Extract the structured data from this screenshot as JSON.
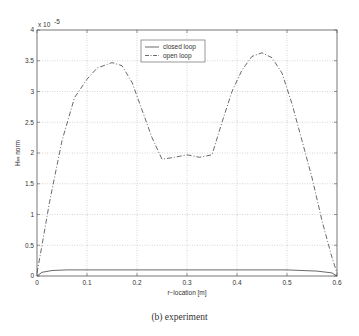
{
  "caption": "(b) experiment",
  "chart_data": {
    "type": "line",
    "title": "",
    "xlabel": "r−location [m]",
    "ylabel": "H_∞ norm",
    "y_multiplier": "x 10^-5",
    "xlim": [
      0,
      0.6
    ],
    "ylim": [
      0,
      4
    ],
    "xticks": [
      0,
      0.1,
      0.2,
      0.3,
      0.4,
      0.5,
      0.6
    ],
    "xtick_labels": [
      "0",
      "0.1",
      "0.2",
      "0.3",
      "0.4",
      "0.5",
      "0.6"
    ],
    "yticks": [
      0,
      0.5,
      1,
      1.5,
      2,
      2.5,
      3,
      3.5,
      4
    ],
    "ytick_labels": [
      "0",
      "0.5",
      "1",
      "1.5",
      "2",
      "2.5",
      "3",
      "3.5",
      "4"
    ],
    "grid": true,
    "legend_position": "upper center",
    "series": [
      {
        "name": "closed loop",
        "style": "solid",
        "x": [
          0,
          0.01,
          0.03,
          0.06,
          0.1,
          0.2,
          0.3,
          0.4,
          0.5,
          0.56,
          0.59,
          0.6
        ],
        "y": [
          0.0,
          0.06,
          0.09,
          0.1,
          0.1,
          0.1,
          0.1,
          0.1,
          0.1,
          0.08,
          0.05,
          0.0
        ]
      },
      {
        "name": "open loop",
        "style": "dashdot",
        "x": [
          0,
          0.01,
          0.025,
          0.05,
          0.075,
          0.1,
          0.12,
          0.15,
          0.17,
          0.19,
          0.21,
          0.23,
          0.25,
          0.275,
          0.3,
          0.325,
          0.35,
          0.37,
          0.39,
          0.41,
          0.43,
          0.45,
          0.47,
          0.49,
          0.51,
          0.53,
          0.55,
          0.57,
          0.59,
          0.6
        ],
        "y": [
          0.05,
          0.5,
          1.2,
          2.2,
          2.9,
          3.2,
          3.38,
          3.47,
          3.42,
          3.15,
          2.7,
          2.25,
          1.9,
          1.93,
          1.97,
          1.93,
          1.97,
          2.5,
          3.0,
          3.35,
          3.57,
          3.63,
          3.55,
          3.3,
          2.8,
          2.2,
          1.6,
          0.9,
          0.3,
          0.05
        ]
      }
    ]
  }
}
